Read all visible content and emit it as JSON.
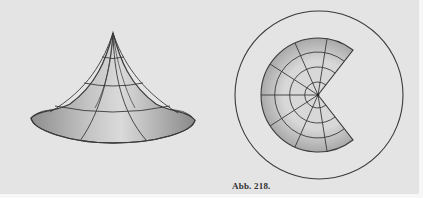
{
  "figure": {
    "caption": "Abb. 218.",
    "panels": [
      {
        "name": "cone-surface",
        "description": "flared conical surface with grid lines"
      },
      {
        "name": "developed-sector",
        "description": "flattened annular sector inside a circle"
      }
    ],
    "colors": {
      "paper": "#e4e4e4",
      "ink": "#3a3a3a",
      "shade": "#b8b8b8"
    }
  }
}
